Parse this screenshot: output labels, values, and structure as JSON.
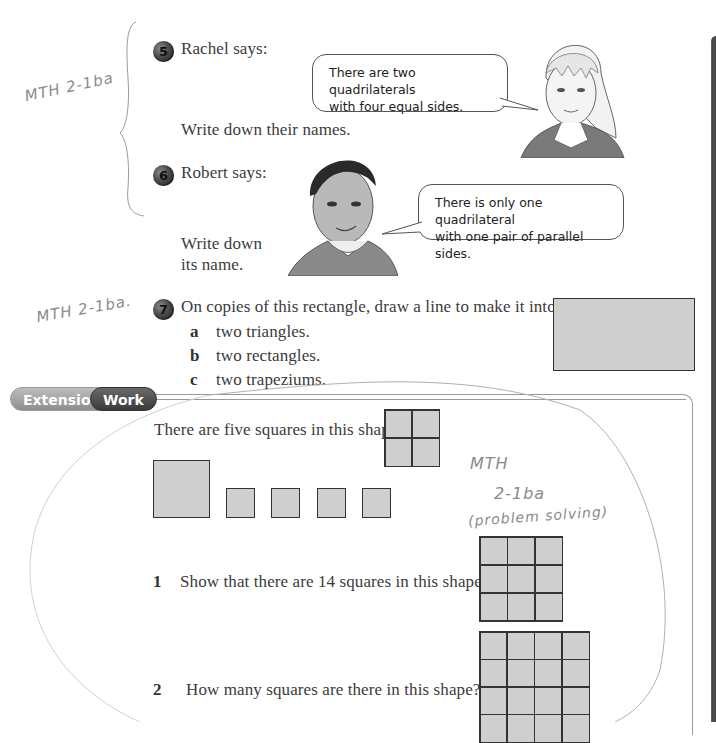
{
  "annotations": {
    "top_left": "MTH 2-1ba",
    "middle_left": "MTH 2-1ba.",
    "right_note_line1": "MTH",
    "right_note_line2": "2-1ba",
    "right_note_line3": "(problem solving)"
  },
  "questions": [
    {
      "number": "5",
      "prompt": "Rachel says:",
      "speech": "There are two quadrilaterals with four equal sides.",
      "speech_line1": "There are two quadrilaterals",
      "speech_line2": "with four equal sides.",
      "instruction": "Write down their names."
    },
    {
      "number": "6",
      "prompt": "Robert says:",
      "speech_line1": "There is only one quadrilateral",
      "speech_line2": "with one pair of parallel sides.",
      "instruction_line1": "Write down",
      "instruction_line2": "its name."
    },
    {
      "number": "7",
      "prompt": "On copies of this rectangle, draw a line to make it into:",
      "parts": [
        {
          "letter": "a",
          "text": "two triangles."
        },
        {
          "letter": "b",
          "text": "two rectangles."
        },
        {
          "letter": "c",
          "text": "two trapeziums."
        }
      ]
    }
  ],
  "extension": {
    "label_part1": "Extension",
    "label_part2": "Work",
    "intro": "There are five squares in this shape:",
    "items": [
      {
        "number": "1",
        "text": "Show that there are 14 squares in this shape."
      },
      {
        "number": "2",
        "text": "How many squares are there in this shape?"
      }
    ]
  },
  "colors": {
    "shape_fill": "#cfcfcf",
    "shape_border": "#333333",
    "text": "#3b3b3b"
  }
}
